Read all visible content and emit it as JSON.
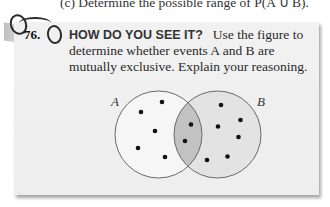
{
  "top_line": "(c) Determine the possible range of P(A ∪ B).",
  "exercise": {
    "number": "76.",
    "heading": "HOW DO YOU SEE IT?",
    "body": "Use the figure to determine whether events A and B are mutually exclusive. Explain your reasoning."
  },
  "venn": {
    "label_a": "A",
    "label_b": "B",
    "colors": {
      "circle_a_fill": "#f6f6f6",
      "circle_b_fill": "#e3e3e3",
      "intersection_fill": "#c2c2c2",
      "outline": "#6a6a6a",
      "dot": "#111111"
    },
    "dots_a_only": 5,
    "dots_intersection": 2,
    "dots_b_only": 6
  }
}
